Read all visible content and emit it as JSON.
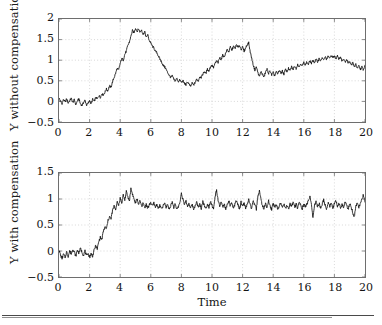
{
  "figure": {
    "title": "",
    "background": "#ffffff",
    "line_color": "#111111",
    "grid_color": "#bdbdbd",
    "axis_color": "#6e6e6e"
  },
  "chart_data": [
    {
      "type": "line",
      "panel": "top",
      "title": "",
      "xlabel": "",
      "ylabel": "Y without compensation",
      "xlim": [
        0,
        20
      ],
      "ylim": [
        -0.5,
        2
      ],
      "xticks": [
        0,
        2,
        4,
        6,
        8,
        10,
        12,
        14,
        16,
        18,
        20
      ],
      "xticklabels": [
        "0",
        "2",
        "4",
        "6",
        "8",
        "10",
        "12",
        "14",
        "16",
        "18",
        "20"
      ],
      "yticks": [
        -0.5,
        0,
        0.5,
        1,
        1.5,
        2
      ],
      "yticklabels": [
        "-0.5",
        "0",
        "0.5",
        "1",
        "1.5",
        "2"
      ],
      "grid": true,
      "grid_style": "dotted",
      "legend": null,
      "series": [
        {
          "name": "Y without compensation",
          "color": "#111111",
          "x": [
            0.0,
            0.1,
            0.2,
            0.3,
            0.4,
            0.5,
            0.6,
            0.7,
            0.8,
            0.9,
            1.0,
            1.1,
            1.2,
            1.3,
            1.4,
            1.5,
            1.6,
            1.7,
            1.8,
            1.9,
            2.0,
            2.1,
            2.2,
            2.3,
            2.4,
            2.5,
            2.6,
            2.7,
            2.8,
            2.9,
            3.0,
            3.1,
            3.2,
            3.3,
            3.4,
            3.5,
            3.6,
            3.7,
            3.8,
            3.9,
            4.0,
            4.1,
            4.2,
            4.3,
            4.4,
            4.5,
            4.6,
            4.7,
            4.8,
            4.9,
            5.0,
            5.1,
            5.2,
            5.3,
            5.4,
            5.5,
            5.6,
            5.7,
            5.8,
            5.9,
            6.0,
            6.1,
            6.2,
            6.3,
            6.4,
            6.5,
            6.6,
            6.7,
            6.8,
            6.9,
            7.0,
            7.1,
            7.2,
            7.3,
            7.4,
            7.5,
            7.6,
            7.7,
            7.8,
            7.9,
            8.0,
            8.1,
            8.2,
            8.3,
            8.4,
            8.5,
            8.6,
            8.7,
            8.8,
            8.9,
            9.0,
            9.1,
            9.2,
            9.3,
            9.4,
            9.5,
            9.6,
            9.7,
            9.8,
            9.9,
            10.0,
            10.1,
            10.2,
            10.3,
            10.4,
            10.5,
            10.6,
            10.7,
            10.8,
            10.9,
            11.0,
            11.1,
            11.2,
            11.3,
            11.4,
            11.5,
            11.6,
            11.7,
            11.8,
            11.9,
            12.0,
            12.1,
            12.2,
            12.3,
            12.4,
            12.5,
            12.6,
            12.7,
            12.8,
            12.9,
            13.0,
            13.1,
            13.2,
            13.3,
            13.4,
            13.5,
            13.6,
            13.7,
            13.8,
            13.9,
            14.0,
            14.1,
            14.2,
            14.3,
            14.4,
            14.5,
            14.6,
            14.7,
            14.8,
            14.9,
            15.0,
            15.1,
            15.2,
            15.3,
            15.4,
            15.5,
            15.6,
            15.7,
            15.8,
            15.9,
            16.0,
            16.1,
            16.2,
            16.3,
            16.4,
            16.5,
            16.6,
            16.7,
            16.8,
            16.9,
            17.0,
            17.1,
            17.2,
            17.3,
            17.4,
            17.5,
            17.6,
            17.7,
            17.8,
            17.9,
            18.0,
            18.1,
            18.2,
            18.3,
            18.4,
            18.5,
            18.6,
            18.7,
            18.8,
            18.9,
            19.0,
            19.1,
            19.2,
            19.3,
            19.4,
            19.5,
            19.6,
            19.7,
            19.8,
            19.9,
            20.0
          ],
          "y": [
            0.08,
            0.0,
            -0.05,
            0.05,
            -0.02,
            0.06,
            -0.04,
            0.02,
            0.07,
            -0.03,
            0.04,
            -0.08,
            0.01,
            0.06,
            -0.06,
            -0.1,
            -0.03,
            0.03,
            -0.09,
            -0.05,
            0.02,
            -0.06,
            0.05,
            0.0,
            0.09,
            0.06,
            0.14,
            0.1,
            0.18,
            0.16,
            0.22,
            0.3,
            0.26,
            0.38,
            0.34,
            0.48,
            0.58,
            0.68,
            0.8,
            0.76,
            0.92,
            1.04,
            1.0,
            1.14,
            1.22,
            1.36,
            1.44,
            1.58,
            1.72,
            1.66,
            1.78,
            1.7,
            1.76,
            1.68,
            1.74,
            1.62,
            1.7,
            1.55,
            1.62,
            1.48,
            1.42,
            1.34,
            1.3,
            1.22,
            1.18,
            1.1,
            1.02,
            0.96,
            0.88,
            0.84,
            0.78,
            0.7,
            0.64,
            0.58,
            0.62,
            0.54,
            0.5,
            0.56,
            0.48,
            0.52,
            0.46,
            0.5,
            0.44,
            0.4,
            0.48,
            0.42,
            0.36,
            0.44,
            0.4,
            0.46,
            0.54,
            0.5,
            0.6,
            0.58,
            0.66,
            0.72,
            0.68,
            0.78,
            0.74,
            0.84,
            0.88,
            0.82,
            0.92,
            0.98,
            0.94,
            1.06,
            1.02,
            1.12,
            1.08,
            1.18,
            1.26,
            1.2,
            1.32,
            1.24,
            1.34,
            1.28,
            1.38,
            1.3,
            1.36,
            1.26,
            1.32,
            1.22,
            1.3,
            1.38,
            1.42,
            1.2,
            1.04,
            0.88,
            0.76,
            0.84,
            0.7,
            0.6,
            0.72,
            0.66,
            0.58,
            0.72,
            0.78,
            0.68,
            0.74,
            0.64,
            0.7,
            0.62,
            0.72,
            0.66,
            0.76,
            0.68,
            0.74,
            0.66,
            0.78,
            0.72,
            0.8,
            0.74,
            0.84,
            0.78,
            0.86,
            0.8,
            0.9,
            0.84,
            0.92,
            0.86,
            0.94,
            0.88,
            0.96,
            0.9,
            0.98,
            0.92,
            1.0,
            0.94,
            1.02,
            0.96,
            1.04,
            0.98,
            1.06,
            1.0,
            1.08,
            1.02,
            1.1,
            1.04,
            1.12,
            1.06,
            1.1,
            1.04,
            1.12,
            1.02,
            1.08,
            0.98,
            1.04,
            0.96,
            1.02,
            0.92,
            0.98,
            0.88,
            0.94,
            0.84,
            0.9,
            0.8,
            0.86,
            0.78,
            0.84,
            0.76,
            0.88
          ]
        }
      ]
    },
    {
      "type": "line",
      "panel": "bottom",
      "title": "",
      "xlabel": "Time",
      "ylabel": "Y with compensation",
      "xlim": [
        0,
        20
      ],
      "ylim": [
        -0.5,
        1.5
      ],
      "xticks": [
        0,
        2,
        4,
        6,
        8,
        10,
        12,
        14,
        16,
        18,
        20
      ],
      "xticklabels": [
        "0",
        "2",
        "4",
        "6",
        "8",
        "10",
        "12",
        "14",
        "16",
        "18",
        "20"
      ],
      "yticks": [
        -0.5,
        0,
        0.5,
        1,
        1.5
      ],
      "yticklabels": [
        "-0.5",
        "0",
        "0.5",
        "1",
        "1.5"
      ],
      "grid": true,
      "grid_style": "dotted",
      "legend": null,
      "series": [
        {
          "name": "Y with compensation",
          "color": "#111111",
          "x": [
            0.0,
            0.1,
            0.2,
            0.3,
            0.4,
            0.5,
            0.6,
            0.7,
            0.8,
            0.9,
            1.0,
            1.1,
            1.2,
            1.3,
            1.4,
            1.5,
            1.6,
            1.7,
            1.8,
            1.9,
            2.0,
            2.1,
            2.2,
            2.3,
            2.4,
            2.5,
            2.6,
            2.7,
            2.8,
            2.9,
            3.0,
            3.1,
            3.2,
            3.3,
            3.4,
            3.5,
            3.6,
            3.7,
            3.8,
            3.9,
            4.0,
            4.1,
            4.2,
            4.3,
            4.4,
            4.5,
            4.6,
            4.7,
            4.8,
            4.9,
            5.0,
            5.1,
            5.2,
            5.3,
            5.4,
            5.5,
            5.6,
            5.7,
            5.8,
            5.9,
            6.0,
            6.1,
            6.2,
            6.3,
            6.4,
            6.5,
            6.6,
            6.7,
            6.8,
            6.9,
            7.0,
            7.1,
            7.2,
            7.3,
            7.4,
            7.5,
            7.6,
            7.7,
            7.8,
            7.9,
            8.0,
            8.1,
            8.2,
            8.3,
            8.4,
            8.5,
            8.6,
            8.7,
            8.8,
            8.9,
            9.0,
            9.1,
            9.2,
            9.3,
            9.4,
            9.5,
            9.6,
            9.7,
            9.8,
            9.9,
            10.0,
            10.1,
            10.2,
            10.3,
            10.4,
            10.5,
            10.6,
            10.7,
            10.8,
            10.9,
            11.0,
            11.1,
            11.2,
            11.3,
            11.4,
            11.5,
            11.6,
            11.7,
            11.8,
            11.9,
            12.0,
            12.1,
            12.2,
            12.3,
            12.4,
            12.5,
            12.6,
            12.7,
            12.8,
            12.9,
            13.0,
            13.1,
            13.2,
            13.3,
            13.4,
            13.5,
            13.6,
            13.7,
            13.8,
            13.9,
            14.0,
            14.1,
            14.2,
            14.3,
            14.4,
            14.5,
            14.6,
            14.7,
            14.8,
            14.9,
            15.0,
            15.1,
            15.2,
            15.3,
            15.4,
            15.5,
            15.6,
            15.7,
            15.8,
            15.9,
            16.0,
            16.1,
            16.2,
            16.3,
            16.4,
            16.5,
            16.6,
            16.7,
            16.8,
            16.9,
            17.0,
            17.1,
            17.2,
            17.3,
            17.4,
            17.5,
            17.6,
            17.7,
            17.8,
            17.9,
            18.0,
            18.1,
            18.2,
            18.3,
            18.4,
            18.5,
            18.6,
            18.7,
            18.8,
            18.9,
            19.0,
            19.1,
            19.2,
            19.3,
            19.4,
            19.5,
            19.6,
            19.7,
            19.8,
            19.9,
            20.0
          ],
          "y": [
            0.02,
            -0.08,
            -0.14,
            -0.06,
            -0.12,
            -0.02,
            -0.1,
            0.0,
            -0.06,
            0.04,
            -0.02,
            -0.1,
            0.02,
            -0.04,
            0.05,
            -0.02,
            -0.08,
            0.0,
            -0.1,
            -0.04,
            -0.12,
            -0.05,
            -0.1,
            0.02,
            0.1,
            0.04,
            0.18,
            0.26,
            0.22,
            0.38,
            0.46,
            0.42,
            0.58,
            0.66,
            0.62,
            0.78,
            0.86,
            0.8,
            0.94,
            0.88,
            1.02,
            0.92,
            1.08,
            0.98,
            1.14,
            1.04,
            0.96,
            1.2,
            1.1,
            1.0,
            0.92,
            1.0,
            0.9,
            0.96,
            0.86,
            0.92,
            0.84,
            0.9,
            0.82,
            0.88,
            0.94,
            0.86,
            0.92,
            0.84,
            0.9,
            0.82,
            0.88,
            0.8,
            0.86,
            0.92,
            0.84,
            0.9,
            0.8,
            0.88,
            0.94,
            0.84,
            0.9,
            0.8,
            0.86,
            0.92,
            1.12,
            1.0,
            0.88,
            0.96,
            0.86,
            0.92,
            0.82,
            0.9,
            0.8,
            0.88,
            0.94,
            0.84,
            0.9,
            0.82,
            0.96,
            0.88,
            0.8,
            0.92,
            0.84,
            0.96,
            0.88,
            0.8,
            1.04,
            1.18,
            0.96,
            0.86,
            0.94,
            0.84,
            0.9,
            0.8,
            0.88,
            0.96,
            0.86,
            0.92,
            0.82,
            0.9,
            0.98,
            0.88,
            0.8,
            0.94,
            0.86,
            0.92,
            0.82,
            0.9,
            0.98,
            0.88,
            0.82,
            0.96,
            0.88,
            0.8,
            1.06,
            1.16,
            0.98,
            0.88,
            0.8,
            0.92,
            0.84,
            0.96,
            0.86,
            0.8,
            0.92,
            0.84,
            0.9,
            0.8,
            0.88,
            0.94,
            0.84,
            0.9,
            0.82,
            0.88,
            0.8,
            0.92,
            0.86,
            0.94,
            0.84,
            0.9,
            0.82,
            0.96,
            0.88,
            0.8,
            0.92,
            0.84,
            0.9,
            0.96,
            1.04,
            0.92,
            0.62,
            0.88,
            0.94,
            0.86,
            0.92,
            0.82,
            0.9,
            0.98,
            0.88,
            0.8,
            0.94,
            0.86,
            0.92,
            0.84,
            0.9,
            0.96,
            0.86,
            0.92,
            0.82,
            0.9,
            0.84,
            0.96,
            0.88,
            0.8,
            0.92,
            0.84,
            0.74,
            0.64,
            0.86,
            0.94,
            0.84,
            0.92,
            1.0,
            1.08,
            0.94
          ]
        }
      ]
    }
  ]
}
